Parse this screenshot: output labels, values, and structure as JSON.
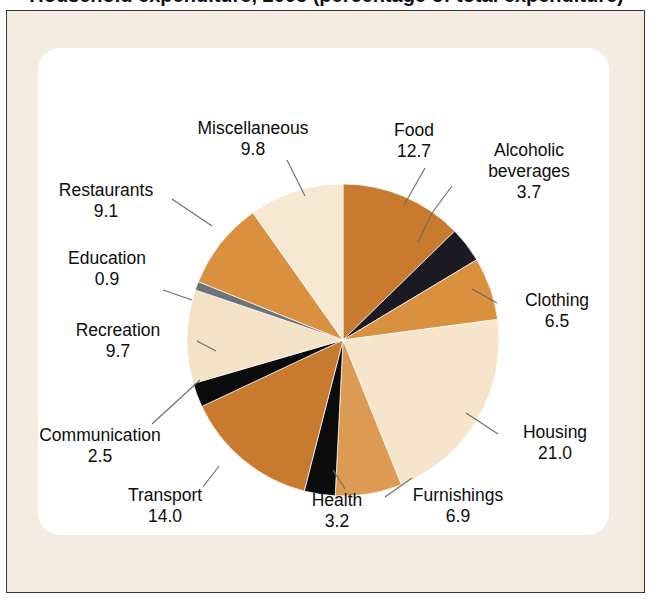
{
  "title": "Household expenditure, 2005 (percentage of total expenditure)",
  "chart_data": {
    "type": "pie",
    "title": "Household expenditure, 2005 (percentage of total expenditure)",
    "unit": "percent",
    "value_total": 100.0,
    "start_angle_deg": 0,
    "direction": "clockwise",
    "legend": "none (direct labels with leader lines)",
    "categories": [
      "Food",
      "Alcoholic beverages",
      "Clothing",
      "Housing",
      "Furnishings",
      "Health",
      "Transport",
      "Communication",
      "Recreation",
      "Education",
      "Restaurants",
      "Miscellaneous"
    ],
    "values": [
      12.7,
      3.7,
      6.5,
      21.0,
      6.9,
      3.2,
      14.0,
      2.5,
      9.7,
      0.9,
      9.1,
      9.8
    ],
    "colors": [
      "#c87a2e",
      "#1b1a22",
      "#d9903f",
      "#f6e5cb",
      "#dd9a53",
      "#0c0b0c",
      "#c87a2e",
      "#0c0b0c",
      "#f3e2c6",
      "#6d7178",
      "#d9903f",
      "#f6e9d3"
    ],
    "slices": [
      {
        "label": "Food",
        "value": 12.7,
        "value_text": "12.7",
        "color": "#c87a2e"
      },
      {
        "label": "Alcoholic beverages",
        "value": 3.7,
        "value_text": "3.7",
        "color": "#1b1a22"
      },
      {
        "label": "Clothing",
        "value": 6.5,
        "value_text": "6.5",
        "color": "#d9903f"
      },
      {
        "label": "Housing",
        "value": 21.0,
        "value_text": "21.0",
        "color": "#f6e5cb"
      },
      {
        "label": "Furnishings",
        "value": 6.9,
        "value_text": "6.9",
        "color": "#dd9a53"
      },
      {
        "label": "Health",
        "value": 3.2,
        "value_text": "3.2",
        "color": "#0c0b0c"
      },
      {
        "label": "Transport",
        "value": 14.0,
        "value_text": "14.0",
        "color": "#c87a2e"
      },
      {
        "label": "Communication",
        "value": 2.5,
        "value_text": "2.5",
        "color": "#0c0b0c"
      },
      {
        "label": "Recreation",
        "value": 9.7,
        "value_text": "9.7",
        "color": "#f3e2c6"
      },
      {
        "label": "Education",
        "value": 0.9,
        "value_text": "0.9",
        "color": "#6d7178"
      },
      {
        "label": "Restaurants",
        "value": 9.1,
        "value_text": "9.1",
        "color": "#d9903f"
      },
      {
        "label": "Miscellaneous",
        "value": 9.8,
        "value_text": "9.8",
        "color": "#f6e9d3"
      }
    ]
  },
  "labels": {
    "food": {
      "name": "Food",
      "value": "12.7"
    },
    "alcoholic": {
      "name": "Alcoholic",
      "name2": "beverages",
      "value": "3.7"
    },
    "clothing": {
      "name": "Clothing",
      "value": "6.5"
    },
    "housing": {
      "name": "Housing",
      "value": "21.0"
    },
    "furnishings": {
      "name": "Furnishings",
      "value": "6.9"
    },
    "health": {
      "name": "Health",
      "value": "3.2"
    },
    "transport": {
      "name": "Transport",
      "value": "14.0"
    },
    "communication": {
      "name": "Communication",
      "value": "2.5"
    },
    "recreation": {
      "name": "Recreation",
      "value": "9.7"
    },
    "education": {
      "name": "Education",
      "value": "0.9"
    },
    "restaurants": {
      "name": "Restaurants",
      "value": "9.1"
    },
    "misc": {
      "name": "Miscellaneous",
      "value": "9.8"
    }
  },
  "style": {
    "frame_bg": "#f3ece0",
    "frame_border": "#3a332c",
    "panel_bg": "#ffffff",
    "text_color": "#0d0d0d",
    "leader_color": "#6b6b6b"
  }
}
